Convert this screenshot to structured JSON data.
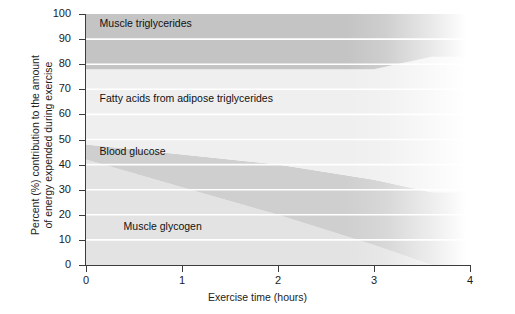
{
  "chart_data": {
    "type": "area",
    "title": "",
    "subtitle": "",
    "xlabel": "Exercise time (hours)",
    "ylabel": "Percent (%) contribution to the amount of energy expended during exercise",
    "ylabel_line1": "Percent (%) contribution to the amount",
    "ylabel_line2": "of energy expended during exercise",
    "stacked": true,
    "grid": true,
    "grid_color": "#ffffff",
    "legend_position": "inline-labels",
    "xlim": [
      0,
      4
    ],
    "ylim": [
      0,
      100
    ],
    "xticks": [
      0,
      1,
      2,
      3,
      4
    ],
    "xtick_labels": [
      "0",
      "1",
      "2",
      "3",
      "4"
    ],
    "yticks": [
      0,
      10,
      20,
      30,
      40,
      50,
      60,
      70,
      80,
      90,
      100
    ],
    "ytick_labels": [
      "0",
      "10",
      "20",
      "30",
      "40",
      "50",
      "60",
      "70",
      "80",
      "90",
      "100"
    ],
    "x": [
      0,
      1,
      2,
      3,
      3.6,
      4
    ],
    "series": [
      {
        "name": "Muscle glycogen",
        "order_from_bottom": 1,
        "color": "#e3e3e3",
        "values": [
          42,
          31,
          20,
          8,
          0,
          0
        ],
        "label_x": 0.35,
        "label_y": 15
      },
      {
        "name": "Blood glucose",
        "order_from_bottom": 2,
        "color": "#cfcfcf",
        "values": [
          6,
          13,
          20,
          26,
          29,
          29
        ],
        "label_x": 0.1,
        "label_y": 45
      },
      {
        "name": "Fatty acids from adipose triglycerides",
        "order_from_bottom": 3,
        "color": "#efefef",
        "values": [
          30,
          34,
          38,
          44,
          54,
          54
        ],
        "label_x": 0.1,
        "label_y": 66
      },
      {
        "name": "Muscle triglycerides",
        "order_from_bottom": 4,
        "color": "#c4c4c4",
        "values": [
          22,
          22,
          22,
          22,
          17,
          17
        ],
        "label_x": 0.1,
        "label_y": 96
      }
    ],
    "cumulative_tops": {
      "muscle_glycogen": [
        42,
        31,
        20,
        8,
        0,
        0
      ],
      "blood_glucose": [
        48,
        44,
        40,
        34,
        29,
        29
      ],
      "fatty_acids": [
        78,
        78,
        78,
        78,
        83,
        83
      ],
      "muscle_triglycerides": [
        100,
        100,
        100,
        100,
        100,
        100
      ]
    }
  },
  "axis": {
    "x_title": "Exercise time (hours)",
    "y_title_line1": "Percent (%) contribution to the amount",
    "y_title_line2": "of energy expended during exercise"
  },
  "labels": {
    "muscle_triglycerides": "Muscle triglycerides",
    "fatty_acids": "Fatty acids from adipose triglycerides",
    "blood_glucose": "Blood glucose",
    "muscle_glycogen": "Muscle glycogen"
  }
}
